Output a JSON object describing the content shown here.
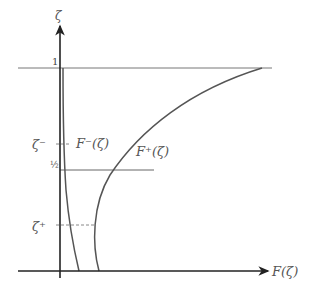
{
  "diagram": {
    "axes": {
      "y_label": "ζ",
      "x_label": "F(ζ)"
    },
    "levels": {
      "one": "1",
      "half": "½",
      "zeta_minus": "ζ⁻",
      "zeta_plus": "ζ⁺"
    },
    "curves": {
      "f_minus": "F⁻(ζ)",
      "f_plus": "F⁺(ζ)"
    },
    "colors": {
      "axis": "#222222",
      "curve": "#555555",
      "line": "#666666",
      "label": "#555555"
    }
  }
}
